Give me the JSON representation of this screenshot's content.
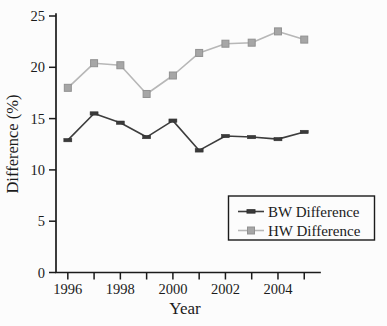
{
  "figure": {
    "background": "#fcfcfc",
    "axis_color": "#1b1b1b"
  },
  "chart_data": {
    "type": "line",
    "title": "",
    "xlabel": "Year",
    "ylabel": "Difference (%)",
    "x": [
      1996,
      1997,
      1998,
      1999,
      2000,
      2001,
      2002,
      2003,
      2004,
      2005
    ],
    "xlim": [
      1995.55,
      2005.6
    ],
    "ylim": [
      0,
      25
    ],
    "yticks": [
      0,
      5,
      10,
      15,
      20,
      25
    ],
    "xtick_labeled_years": [
      1996,
      1998,
      2000,
      2002,
      2004
    ],
    "grid": false,
    "legend_position": "lower-right",
    "series": [
      {
        "name": "BW Difference",
        "marker": "dash",
        "line_color": "#3d3d3d",
        "marker_color": "#3a3a3a",
        "marker_stroke": "#2e2e2e",
        "values": [
          12.9,
          15.5,
          14.6,
          13.2,
          14.8,
          11.9,
          13.3,
          13.2,
          13.0,
          13.7
        ]
      },
      {
        "name": "HW Difference",
        "marker": "square",
        "line_color": "#b7b7b7",
        "marker_color": "#a6a6a6",
        "marker_stroke": "#919191",
        "values": [
          18.0,
          20.4,
          20.2,
          17.4,
          19.2,
          21.4,
          22.3,
          22.4,
          23.5,
          22.7
        ]
      }
    ]
  }
}
